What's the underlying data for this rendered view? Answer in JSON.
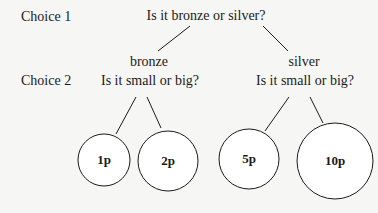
{
  "diagram": {
    "row_labels": {
      "choice1": "Choice 1",
      "choice2": "Choice 2"
    },
    "root_question": "Is it bronze or silver?",
    "branches": [
      {
        "label": "bronze",
        "question": "Is it small or big?",
        "leaves": [
          {
            "label": "1p",
            "size": "small"
          },
          {
            "label": "2p",
            "size": "big"
          }
        ]
      },
      {
        "label": "silver",
        "question": "Is it small or big?",
        "leaves": [
          {
            "label": "5p",
            "size": "small"
          },
          {
            "label": "10p",
            "size": "big"
          }
        ]
      }
    ],
    "colors": {
      "background": "#f6f6f4",
      "ink": "#1a1a1a"
    }
  }
}
